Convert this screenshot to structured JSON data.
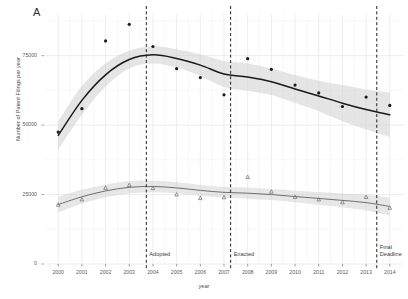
{
  "panel": {
    "label": "A"
  },
  "axes": {
    "ylabel": "Number of Patent Filings per year",
    "xlabel": "year",
    "yticks": [
      "0",
      "25000",
      "50000",
      "75000"
    ],
    "ytick_values": [
      0,
      25000,
      50000,
      75000
    ],
    "xticks": [
      "2000",
      "2001",
      "2002",
      "2003",
      "2004",
      "2005",
      "2006",
      "2007",
      "2008",
      "2009",
      "2010",
      "2011",
      "2012",
      "2013",
      "2014"
    ],
    "ylim": [
      0,
      90000
    ],
    "xlim": [
      1999.4,
      2014.6
    ]
  },
  "annotations": [
    {
      "name": "adopted",
      "label": "Adopted",
      "x": 2003.72
    },
    {
      "name": "enacted",
      "label": "Enacted",
      "x": 2007.28
    },
    {
      "name": "final-deadline",
      "label": "Final\nDeadline",
      "line1": "Final",
      "line2": "Deadline",
      "x": 2013.45
    }
  ],
  "colors": {
    "series_upper": "#1a1a1a",
    "series_lower": "#6f6f6f",
    "ribbon": "#cfcfcf",
    "grid": "#e8e8e8",
    "vline": "#222222",
    "text": "#4a4a4a",
    "background": "#ffffff"
  },
  "chart_data": {
    "type": "scatter",
    "title": "",
    "xlabel": "year",
    "ylabel": "Number of Patent Filings per year",
    "xlim": [
      1999.4,
      2014.6
    ],
    "ylim": [
      0,
      90000
    ],
    "grid": true,
    "legend": "none",
    "x": [
      2000,
      2001,
      2002,
      2003,
      2004,
      2005,
      2006,
      2007,
      2008,
      2009,
      2010,
      2011,
      2012,
      2013,
      2014
    ],
    "series": [
      {
        "name": "Upper series (patent filings)",
        "marker": "circle",
        "color": "#1a1a1a",
        "values": [
          47500,
          55900,
          80300,
          86300,
          78300,
          70300,
          67100,
          60900,
          73900,
          70100,
          64400,
          61600,
          56700,
          60100,
          57100
        ],
        "fit": [
          46300,
          58900,
          68100,
          73600,
          75300,
          74000,
          71600,
          68400,
          67300,
          65600,
          63000,
          60500,
          57900,
          55600,
          53700
        ],
        "fit_ci_low": [
          41200,
          53700,
          63900,
          70400,
          72200,
          70700,
          67700,
          63700,
          62400,
          60800,
          58000,
          55000,
          51400,
          48400,
          45700
        ],
        "fit_ci_high": [
          51400,
          64100,
          72300,
          76800,
          78400,
          77300,
          75500,
          73100,
          72200,
          70400,
          68000,
          66000,
          64400,
          62800,
          61700
        ]
      },
      {
        "name": "Lower series",
        "marker": "triangle",
        "color": "#6f6f6f",
        "values": [
          21300,
          23200,
          27400,
          28400,
          27300,
          25000,
          23700,
          24000,
          31300,
          26000,
          24100,
          23200,
          22200,
          24100,
          20200
        ],
        "fit": [
          21400,
          24200,
          26300,
          27600,
          27900,
          27400,
          26500,
          25800,
          25500,
          25000,
          24300,
          23600,
          22900,
          22100,
          20700
        ],
        "fit_ci_low": [
          18600,
          21700,
          24000,
          25400,
          25800,
          25400,
          24600,
          23900,
          23500,
          23000,
          22200,
          21300,
          20400,
          19300,
          17500
        ],
        "fit_ci_high": [
          24200,
          26700,
          28600,
          29800,
          30000,
          29400,
          28400,
          27700,
          27500,
          27000,
          26400,
          25900,
          25400,
          24900,
          23900
        ]
      }
    ]
  }
}
